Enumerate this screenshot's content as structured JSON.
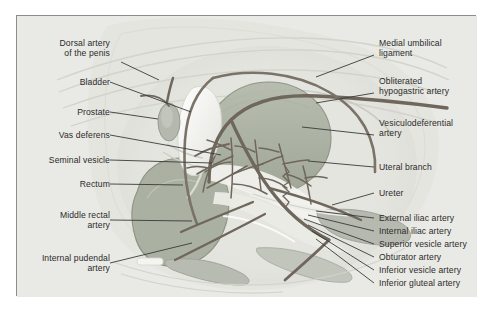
{
  "figure": {
    "frame_color": "#8d8d8d",
    "background_color": "#e9e9e5",
    "page_color": "#ffffff",
    "leader_color": "#3a3a3a",
    "text_color": "#2b2b2b"
  },
  "palette": {
    "vessel_dark": "#6b6259",
    "vessel_mid": "#8a8076",
    "organ_green": "#a9b0a0",
    "organ_green_dark": "#98a08e",
    "organ_gray": "#b9bcb4",
    "bladder_white": "#f7f7f3",
    "muscle_gray": "#c3c5bd",
    "bone_gray": "#cfd1c9",
    "outline_gray": "#9a9a92"
  },
  "labels_left": [
    {
      "id": "dorsal-artery-of-the-penis",
      "text": "Dorsal artery\nof the penis"
    },
    {
      "id": "bladder",
      "text": "Bladder"
    },
    {
      "id": "prostate",
      "text": "Prostate"
    },
    {
      "id": "vas-deferens",
      "text": "Vas deferens"
    },
    {
      "id": "seminal-vesicle",
      "text": "Seminal vesicle"
    },
    {
      "id": "rectum",
      "text": "Rectum"
    },
    {
      "id": "middle-rectal-artery",
      "text": "Middle rectal\nartery"
    },
    {
      "id": "internal-pudendal-artery",
      "text": "Internal pudendal\nartery"
    }
  ],
  "labels_right": [
    {
      "id": "medial-umbilical-ligament",
      "text": "Medial umbilical\nligament"
    },
    {
      "id": "obliterated-hypogastric-artery",
      "text": "Obliterated\nhypogastric artery"
    },
    {
      "id": "vesiculodeferential-artery",
      "text": "Vesiculodeferential\nartery"
    },
    {
      "id": "uteral-branch",
      "text": "Uteral branch"
    },
    {
      "id": "ureter",
      "text": "Ureter"
    },
    {
      "id": "external-iliac-artery",
      "text": "External iliac artery"
    },
    {
      "id": "internal-iliac-artery",
      "text": "Internal iliac artery"
    },
    {
      "id": "superior-vesicle-artery",
      "text": "Superior vesicle artery"
    },
    {
      "id": "obturator-artery",
      "text": "Obturator artery"
    },
    {
      "id": "inferior-vesicle-artery",
      "text": "Inferior vesicle artery"
    },
    {
      "id": "inferior-gluteal-artery",
      "text": "Inferior gluteal artery"
    }
  ]
}
